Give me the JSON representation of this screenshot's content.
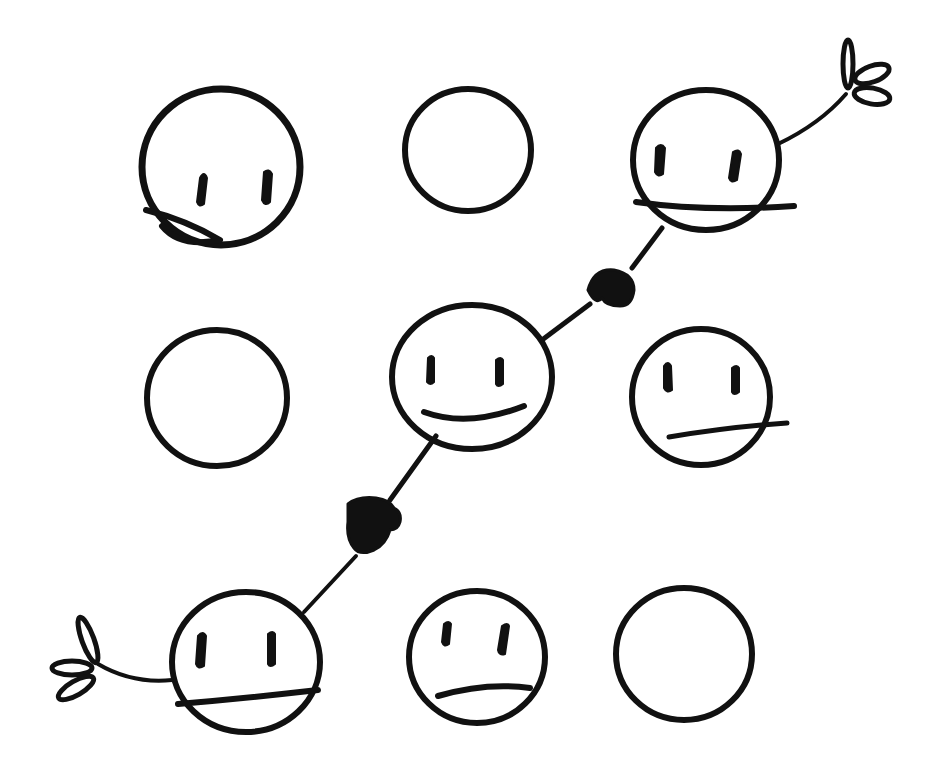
{
  "colors": {
    "ink": "#111111",
    "paper": "#ffffff"
  },
  "grid": {
    "rows": 3,
    "cols": 3,
    "cells": [
      {
        "row": 0,
        "col": 0,
        "label": "face-top-left",
        "state": "face",
        "expression": "eyes with chin line",
        "cx": 221,
        "cy": 167,
        "r": 78
      },
      {
        "row": 0,
        "col": 1,
        "label": "circle-top-middle",
        "state": "empty",
        "cx": 468,
        "cy": 150,
        "r": 63
      },
      {
        "row": 0,
        "col": 2,
        "label": "face-top-right",
        "state": "face",
        "expression": "eyes with flat mouth",
        "cx": 706,
        "cy": 162,
        "r": 72,
        "holding": "flower"
      },
      {
        "row": 1,
        "col": 0,
        "label": "circle-middle-left",
        "state": "empty",
        "cx": 217,
        "cy": 398,
        "r": 70
      },
      {
        "row": 1,
        "col": 1,
        "label": "face-center",
        "state": "face",
        "expression": "smile",
        "cx": 472,
        "cy": 377,
        "r": 80
      },
      {
        "row": 1,
        "col": 2,
        "label": "face-middle-right",
        "state": "face",
        "expression": "eyes with slanted mouth",
        "cx": 701,
        "cy": 397,
        "r": 70
      },
      {
        "row": 2,
        "col": 0,
        "label": "face-bottom-left",
        "state": "face",
        "expression": "eyes with flat mouth",
        "cx": 246,
        "cy": 663,
        "r": 74,
        "holding": "flower"
      },
      {
        "row": 2,
        "col": 1,
        "label": "face-bottom-middle",
        "state": "face",
        "expression": "eyes with slanted mouth",
        "cx": 477,
        "cy": 657,
        "r": 68
      },
      {
        "row": 2,
        "col": 2,
        "label": "circle-bottom-right",
        "state": "empty",
        "cx": 684,
        "cy": 654,
        "r": 68
      }
    ]
  },
  "connections": [
    {
      "from": "face-center",
      "to": "face-top-right",
      "via": "handshake-upper"
    },
    {
      "from": "face-center",
      "to": "face-bottom-left",
      "via": "handshake-lower"
    }
  ],
  "decorations": [
    {
      "name": "flower-top-right",
      "attached_to": "face-top-right"
    },
    {
      "name": "flower-bottom-left",
      "attached_to": "face-bottom-left"
    }
  ]
}
